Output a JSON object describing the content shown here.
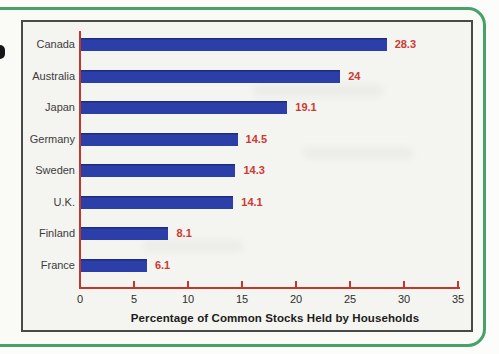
{
  "page": {
    "type": "scanned-textbook-figure",
    "margin_glyph": "partial-bullet-cut-off-at-left-edge"
  },
  "chart_data": {
    "type": "bar",
    "orientation": "horizontal",
    "title": "",
    "xlabel": "Percentage of Common Stocks Held by Households",
    "ylabel": "",
    "categories": [
      "Canada",
      "Australia",
      "Japan",
      "Germany",
      "Sweden",
      "U.K.",
      "Finland",
      "France"
    ],
    "values": [
      28.3,
      24,
      19.1,
      14.5,
      14.3,
      14.1,
      8.1,
      6.1
    ],
    "value_labels": [
      "28.3",
      "24",
      "19.1",
      "14.5",
      "14.3",
      "14.1",
      "8.1",
      "6.1"
    ],
    "xlim": [
      0,
      35
    ],
    "xticks": [
      0,
      5,
      10,
      15,
      20,
      25,
      30,
      35
    ],
    "grid": false,
    "legend": "none"
  },
  "colors": {
    "bar": "#2c3ea8",
    "value_label": "#cd3a33",
    "axis": "#c4372f",
    "category_label": "#3c3c3c",
    "tick_label": "#2e2e2e",
    "axis_title": "#1c1c1c",
    "frame_border": "#48a169",
    "chart_box_border": "#4a4a48",
    "page_background": "#fcfcfa",
    "chart_background": "#f4f4f0"
  }
}
